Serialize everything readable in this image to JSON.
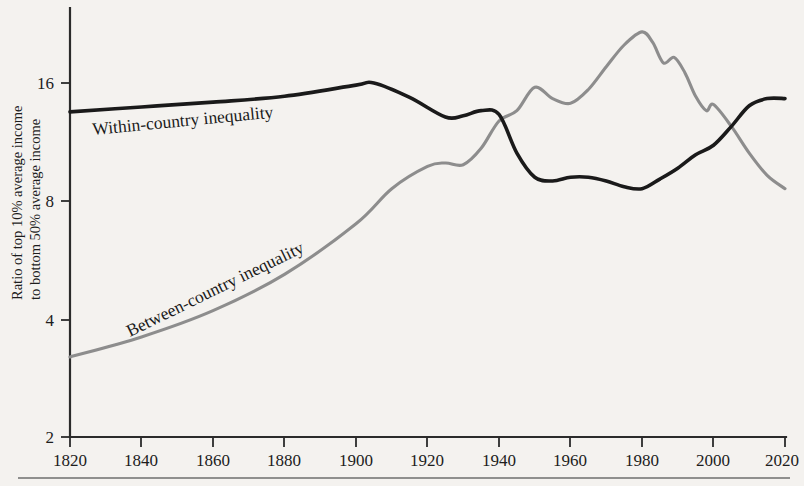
{
  "figure": {
    "background_color": "#f4f2ef",
    "within_color": "#1a1a1a",
    "between_color": "#8d8d8d"
  },
  "axes": {
    "y_title_line1": "Ratio of top 10% average income",
    "y_title_line2": "to bottom 50% average income",
    "y_ticks": [
      "16",
      "8",
      "4",
      "2"
    ],
    "x_ticks": [
      "1820",
      "1840",
      "1860",
      "1880",
      "1900",
      "1920",
      "1940",
      "1960",
      "1980",
      "2000",
      "2020"
    ]
  },
  "labels": {
    "within": "Within-country inequality",
    "between": "Between-country inequality"
  },
  "chart_data": {
    "type": "line",
    "title": "",
    "xlabel": "",
    "ylabel": "Ratio of top 10% average income to bottom 50% average income",
    "x_scale": "linear",
    "y_scale": "log2",
    "xlim": [
      1820,
      2020
    ],
    "ylim": [
      2,
      24
    ],
    "grid": false,
    "legend": "inline-labels",
    "x_tick_values": [
      1820,
      1840,
      1860,
      1880,
      1900,
      1920,
      1940,
      1960,
      1980,
      2000,
      2020
    ],
    "y_tick_values": [
      16,
      8,
      4,
      2
    ],
    "series": [
      {
        "name": "Within-country inequality",
        "color": "#1a1a1a",
        "x": [
          1820,
          1840,
          1860,
          1880,
          1900,
          1905,
          1915,
          1925,
          1930,
          1935,
          1940,
          1945,
          1950,
          1955,
          1960,
          1965,
          1970,
          1975,
          1980,
          1985,
          1990,
          1995,
          2000,
          2005,
          2010,
          2015,
          2020
        ],
        "y": [
          13.5,
          13.9,
          14.3,
          14.8,
          15.8,
          16.0,
          14.7,
          13.1,
          13.2,
          13.6,
          13.3,
          10.6,
          9.2,
          9.0,
          9.2,
          9.2,
          9.0,
          8.7,
          8.6,
          9.1,
          9.7,
          10.5,
          11.1,
          12.4,
          14.0,
          14.6,
          14.6
        ]
      },
      {
        "name": "Between-country inequality",
        "color": "#8d8d8d",
        "x": [
          1820,
          1840,
          1860,
          1880,
          1900,
          1910,
          1920,
          1925,
          1930,
          1935,
          1940,
          1945,
          1950,
          1955,
          1960,
          1965,
          1970,
          1975,
          1980,
          1983,
          1986,
          1989,
          1992,
          1995,
          1998,
          2000,
          2005,
          2010,
          2015,
          2020
        ],
        "y": [
          3.2,
          3.6,
          4.2,
          5.2,
          7.0,
          8.6,
          9.8,
          10.0,
          9.9,
          10.9,
          12.8,
          13.6,
          15.6,
          14.6,
          14.2,
          15.4,
          17.6,
          20.0,
          21.6,
          20.3,
          18.0,
          18.6,
          17.0,
          14.8,
          13.6,
          14.1,
          12.4,
          10.6,
          9.3,
          8.6
        ]
      }
    ]
  }
}
